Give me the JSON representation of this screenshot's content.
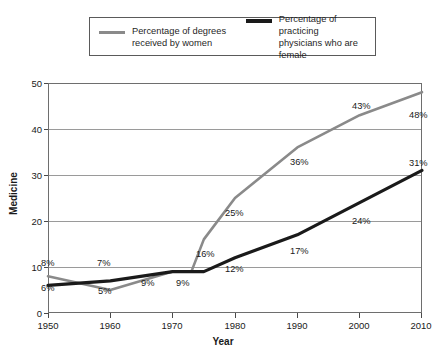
{
  "legend": {
    "entries": [
      {
        "label": "Percentage of degrees\nreceived by women",
        "color": "#8a8a8a"
      },
      {
        "label": "Percentage of practicing\nphysicians who are female",
        "color": "#1a1a1a"
      }
    ]
  },
  "axes": {
    "y_title": "Medicine",
    "x_title": "Year",
    "y_ticks": [
      "0",
      "10",
      "20",
      "30",
      "40",
      "50"
    ],
    "x_ticks": [
      "1950",
      "1960",
      "1970",
      "1980",
      "1990",
      "2000",
      "2010"
    ]
  },
  "chart_data": {
    "type": "line",
    "title": "",
    "xlabel": "Year",
    "ylabel": "Medicine",
    "xlim": [
      1950,
      2010
    ],
    "ylim": [
      0,
      50
    ],
    "yticks": [
      0,
      10,
      20,
      30,
      40,
      50
    ],
    "xticks": [
      1950,
      1960,
      1970,
      1980,
      1990,
      2000,
      2010
    ],
    "grid": "horizontal",
    "legend_position": "top",
    "series": [
      {
        "name": "Percentage of degrees received by women",
        "color": "#8a8a8a",
        "x": [
          1950,
          1960,
          1970,
          1973,
          1975,
          1980,
          1990,
          2000,
          2010
        ],
        "values": [
          8,
          5,
          9,
          9,
          16,
          25,
          36,
          43,
          48
        ],
        "labels": [
          {
            "x": 1950,
            "value": 8,
            "text": "8%"
          },
          {
            "x": 1960,
            "value": 5,
            "text": "5%"
          },
          {
            "x": 1970,
            "value": 9,
            "text": "9%"
          },
          {
            "x": 1975,
            "value": 16,
            "text": "16%"
          },
          {
            "x": 1980,
            "value": 25,
            "text": "25%"
          },
          {
            "x": 1990,
            "value": 36,
            "text": "36%"
          },
          {
            "x": 2000,
            "value": 43,
            "text": "43%"
          },
          {
            "x": 2010,
            "value": 48,
            "text": "48%"
          }
        ]
      },
      {
        "name": "Percentage of practicing physicians who are female",
        "color": "#1a1a1a",
        "x": [
          1950,
          1960,
          1970,
          1975,
          1980,
          1990,
          2000,
          2010
        ],
        "values": [
          6,
          7,
          9,
          9,
          12,
          17,
          24,
          31
        ],
        "labels": [
          {
            "x": 1950,
            "value": 6,
            "text": "6%"
          },
          {
            "x": 1960,
            "value": 7,
            "text": "7%"
          },
          {
            "x": 1975,
            "value": 9,
            "text": "9%"
          },
          {
            "x": 1980,
            "value": 12,
            "text": "12%"
          },
          {
            "x": 1990,
            "value": 17,
            "text": "17%"
          },
          {
            "x": 2000,
            "value": 24,
            "text": "24%"
          },
          {
            "x": 2010,
            "value": 31,
            "text": "31%"
          }
        ]
      }
    ]
  },
  "point_labels": [
    {
      "text": "8%",
      "left": 41,
      "top": 258
    },
    {
      "text": "6%",
      "left": 41,
      "top": 283
    },
    {
      "text": "7%",
      "left": 97,
      "top": 258
    },
    {
      "text": "5%",
      "left": 98,
      "top": 286
    },
    {
      "text": "9%",
      "left": 141,
      "top": 278
    },
    {
      "text": "9%",
      "left": 176,
      "top": 278
    },
    {
      "text": "16%",
      "left": 196,
      "top": 249
    },
    {
      "text": "25%",
      "left": 225,
      "top": 208
    },
    {
      "text": "12%",
      "left": 225,
      "top": 264
    },
    {
      "text": "36%",
      "left": 290,
      "top": 157
    },
    {
      "text": "17%",
      "left": 290,
      "top": 246
    },
    {
      "text": "43%",
      "left": 352,
      "top": 101
    },
    {
      "text": "24%",
      "left": 352,
      "top": 216
    },
    {
      "text": "48%",
      "left": 409,
      "top": 110
    },
    {
      "text": "31%",
      "left": 409,
      "top": 158
    }
  ]
}
